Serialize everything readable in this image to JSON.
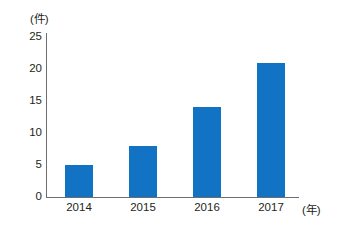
{
  "chart_data": {
    "type": "bar",
    "title": "",
    "subtitle": "",
    "categories": [
      "2014",
      "2015",
      "2016",
      "2017"
    ],
    "values": [
      5,
      8,
      14,
      21
    ],
    "xlabel": "(年)",
    "ylabel": "(件)",
    "ylim": [
      0,
      25
    ],
    "yticks": [
      "0",
      "5",
      "10",
      "15",
      "20",
      "25"
    ],
    "ytick_values": [
      0,
      5,
      10,
      15,
      20,
      25
    ],
    "grid": false,
    "legend": null,
    "annotations": [],
    "series": [
      {
        "name": "",
        "values": [
          5,
          8,
          14,
          21
        ],
        "color": "#1272C4"
      }
    ]
  },
  "axes": {
    "y_unit_label": "(件)",
    "x_unit_label": "(年)",
    "axis_color": "#6D6E71"
  },
  "colors": {
    "bar": "#1272C4",
    "background": "#FFFFFF",
    "text": "#231F20",
    "axis": "#6D6E71"
  }
}
